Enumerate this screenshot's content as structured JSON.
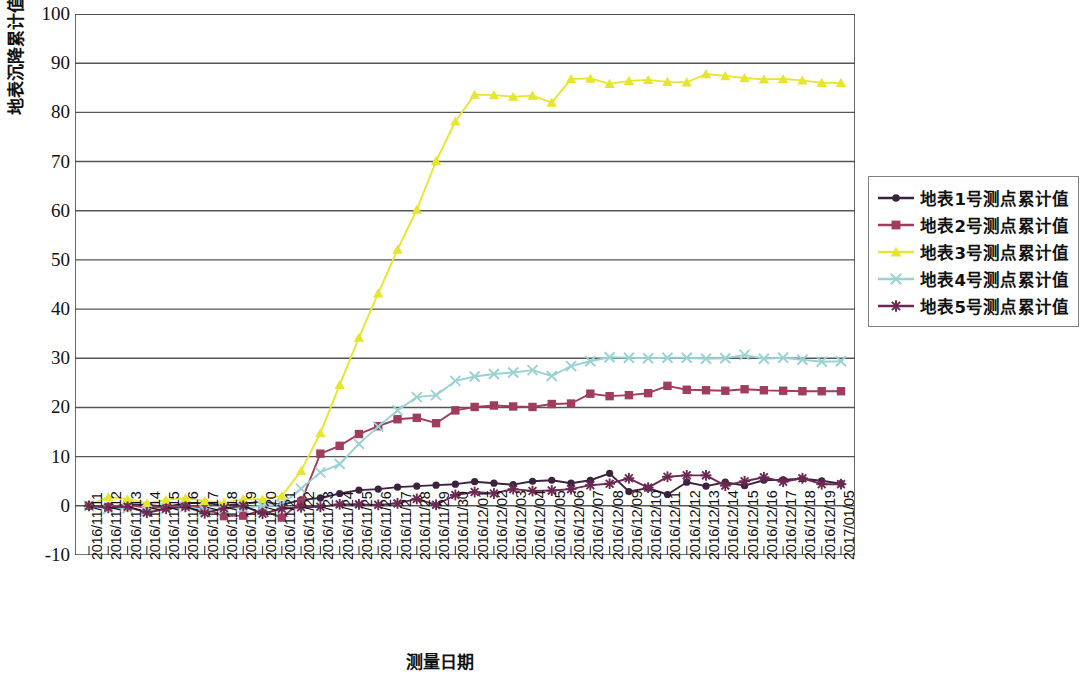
{
  "chart_data": {
    "type": "line",
    "title": "",
    "xlabel": "测量日期",
    "ylabel": "地表沉降累计值(mm)",
    "ylim": [
      -10,
      100
    ],
    "ytick_labels": [
      "100",
      "90",
      "80",
      "70",
      "60",
      "50",
      "40",
      "30",
      "20",
      "10",
      "0",
      "-10"
    ],
    "ytick_values": [
      100,
      90,
      80,
      70,
      60,
      50,
      40,
      30,
      20,
      10,
      0,
      -10
    ],
    "grid": true,
    "legend_position": "right",
    "categories": [
      "2016/11/11",
      "2016/11/12",
      "2016/11/13",
      "2016/11/14",
      "2016/11/15",
      "2016/11/16",
      "2016/11/17",
      "2016/11/18",
      "2016/11/19",
      "2016/11/20",
      "2016/11/21",
      "2016/11/22",
      "2016/11/23",
      "2016/11/24",
      "2016/11/25",
      "2016/11/26",
      "2016/11/27",
      "2016/11/28",
      "2016/11/29",
      "2016/11/30",
      "2016/12/01",
      "2016/12/02",
      "2016/12/03",
      "2016/12/04",
      "2016/12/05",
      "2016/12/06",
      "2016/12/07",
      "2016/12/08",
      "2016/12/09",
      "2016/12/10",
      "2016/12/11",
      "2016/12/12",
      "2016/12/13",
      "2016/12/14",
      "2016/12/15",
      "2016/12/16",
      "2016/12/17",
      "2016/12/18",
      "2016/12/19",
      "2017/01/05"
    ],
    "series": [
      {
        "name": "地表1号测点累计值",
        "color": "#3b2340",
        "marker": "diamond",
        "values": [
          0,
          -0.3,
          0.3,
          0.2,
          -0.2,
          0.5,
          0.6,
          0.1,
          0.4,
          0.9,
          0.2,
          1.2,
          1.6,
          2.5,
          3.2,
          3.4,
          3.8,
          4.0,
          4.2,
          4.4,
          4.9,
          4.6,
          4.3,
          5.0,
          5.2,
          4.6,
          5.2,
          6.6,
          2.9,
          3.6,
          2.3,
          4.8,
          4.0,
          4.8,
          4.1,
          5.2,
          5.3,
          5.5,
          5.1,
          4.5
        ]
      },
      {
        "name": "地表2号测点累计值",
        "color": "#a03c5e",
        "marker": "square",
        "values": [
          0,
          -0.2,
          0.2,
          -0.4,
          -0.3,
          0.1,
          -0.5,
          -2.1,
          -2.0,
          -0.9,
          -2.4,
          0.8,
          10.6,
          12.2,
          14.6,
          16.2,
          17.6,
          17.9,
          16.8,
          19.4,
          20.1,
          20.4,
          20.2,
          20.1,
          20.7,
          20.8,
          22.8,
          22.3,
          22.5,
          22.9,
          24.4,
          23.6,
          23.5,
          23.4,
          23.7,
          23.5,
          23.4,
          23.3,
          23.3,
          23.3
        ]
      },
      {
        "name": "地表3号测点累计值",
        "color": "#e6e62e",
        "marker": "triangle",
        "values": [
          0.2,
          1.8,
          1.4,
          0.5,
          1.2,
          1.6,
          1.0,
          0.6,
          1.4,
          1.3,
          2.0,
          7.1,
          14.8,
          24.6,
          34.2,
          43.2,
          52.1,
          60.2,
          70.1,
          78.2,
          83.6,
          83.5,
          83.2,
          83.4,
          82.0,
          86.8,
          86.9,
          85.8,
          86.4,
          86.6,
          86.2,
          86.1,
          87.8,
          87.4,
          87.0,
          86.7,
          86.8,
          86.5,
          86.0,
          86.0
        ]
      },
      {
        "name": "地表4号测点累计值",
        "color": "#9ad2d4",
        "marker": "cross",
        "values": [
          0,
          -0.6,
          -0.5,
          -1.0,
          -0.6,
          -0.2,
          -0.9,
          -0.6,
          -0.4,
          0.0,
          0.3,
          3.5,
          6.8,
          8.5,
          12.6,
          16.1,
          19.4,
          22.1,
          22.5,
          25.4,
          26.3,
          26.8,
          27.1,
          27.6,
          26.4,
          28.4,
          29.4,
          30.2,
          30.1,
          30.0,
          30.1,
          30.1,
          29.9,
          30.0,
          30.7,
          29.9,
          30.1,
          29.7,
          29.3,
          29.4
        ]
      },
      {
        "name": "地表5号测点累计值",
        "color": "#6b2a52",
        "marker": "asterisk",
        "values": [
          0,
          -0.4,
          -0.2,
          -1.4,
          -0.6,
          -0.2,
          -1.5,
          -0.5,
          0.0,
          -1.6,
          -0.6,
          -0.3,
          -0.2,
          0.3,
          0.3,
          0.2,
          0.5,
          1.4,
          0.2,
          2.2,
          2.8,
          2.5,
          3.4,
          3.0,
          3.1,
          3.4,
          4.2,
          4.5,
          5.6,
          3.7,
          5.9,
          6.2,
          6.2,
          4.1,
          5.0,
          5.8,
          4.9,
          5.6,
          4.4,
          4.4
        ]
      }
    ]
  },
  "legend": {
    "items": [
      {
        "label": "地表1号测点累计值"
      },
      {
        "label": "地表2号测点累计值"
      },
      {
        "label": "地表3号测点累计值"
      },
      {
        "label": "地表4号测点累计值"
      },
      {
        "label": "地表5号测点累计值"
      }
    ]
  },
  "axes": {
    "y_title": "地表沉降累计值(mm)",
    "x_title": "测量日期"
  }
}
